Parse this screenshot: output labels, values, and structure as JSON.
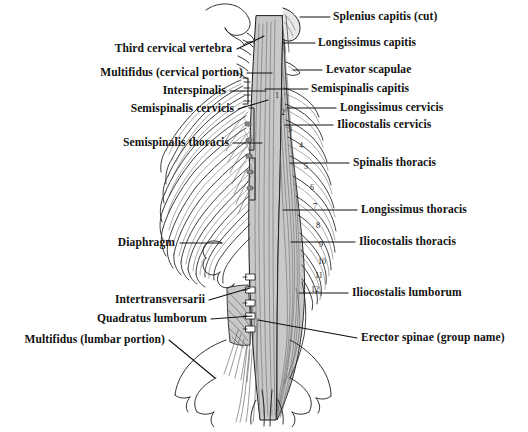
{
  "figure": {
    "width": 528,
    "height": 432,
    "background_color": "#ffffff",
    "ink_color": "#1a1a1a",
    "muscle_fill_color": "#c8c8c8",
    "bone_fill_color": "#ffffff",
    "shadow_fill_color": "#9a9a9a"
  },
  "labels_left": [
    {
      "text": "Third cervical vertebra",
      "x": 232,
      "y": 52,
      "leader": {
        "x1": 237,
        "y1": 49,
        "x2": 264,
        "y2": 36,
        "bend": [
          252,
          42
        ]
      }
    },
    {
      "text": "Multifidus (cervical portion)",
      "x": 243,
      "y": 76,
      "leader": {
        "x1": 247,
        "y1": 73,
        "x2": 272,
        "y2": 73
      }
    },
    {
      "text": "Interspinalis",
      "x": 226,
      "y": 94,
      "leader": {
        "x1": 230,
        "y1": 91,
        "x2": 266,
        "y2": 91
      }
    },
    {
      "text": "Semispinalis cervicis",
      "x": 234,
      "y": 112,
      "leader": {
        "x1": 238,
        "y1": 109,
        "x2": 268,
        "y2": 100
      }
    },
    {
      "text": "Semispinalis thoracis",
      "x": 229,
      "y": 146,
      "leader": {
        "x1": 233,
        "y1": 143,
        "x2": 262,
        "y2": 143
      }
    },
    {
      "text": "Diaphragm",
      "x": 175,
      "y": 246,
      "leader": {
        "x1": 180,
        "y1": 243,
        "x2": 222,
        "y2": 243
      }
    },
    {
      "text": "Intertransversarii",
      "x": 205,
      "y": 303,
      "leader": {
        "x1": 209,
        "y1": 300,
        "x2": 250,
        "y2": 288
      }
    },
    {
      "text": "Quadratus lumborum",
      "x": 207,
      "y": 322,
      "leader": {
        "x1": 211,
        "y1": 319,
        "x2": 252,
        "y2": 316
      }
    },
    {
      "text": "Multifidus (lumbar portion)",
      "x": 165,
      "y": 343,
      "leader": {
        "x1": 169,
        "y1": 340,
        "x2": 215,
        "y2": 378
      }
    }
  ],
  "labels_right": [
    {
      "text": "Splenius capitis (cut)",
      "x": 333,
      "y": 20,
      "leader": {
        "x1": 330,
        "y1": 17,
        "x2": 300,
        "y2": 17
      }
    },
    {
      "text": "Longissimus capitis",
      "x": 318,
      "y": 46,
      "leader": {
        "x1": 315,
        "y1": 43,
        "x2": 283,
        "y2": 43
      }
    },
    {
      "text": "Levator scapulae",
      "x": 326,
      "y": 73,
      "leader": {
        "x1": 322,
        "y1": 70,
        "x2": 293,
        "y2": 70
      }
    },
    {
      "text": "Semispinalis capitis",
      "x": 311,
      "y": 92,
      "leader": {
        "x1": 308,
        "y1": 89,
        "x2": 265,
        "y2": 89
      }
    },
    {
      "text": "Longissimus cervicis",
      "x": 340,
      "y": 111,
      "leader": {
        "x1": 336,
        "y1": 108,
        "x2": 287,
        "y2": 108
      }
    },
    {
      "text": "Iliocostalis cervicis",
      "x": 337,
      "y": 128,
      "leader": {
        "x1": 333,
        "y1": 125,
        "x2": 285,
        "y2": 125
      }
    },
    {
      "text": "Spinalis thoracis",
      "x": 353,
      "y": 166,
      "leader": {
        "x1": 349,
        "y1": 163,
        "x2": 290,
        "y2": 163
      }
    },
    {
      "text": "Longissimus thoracis",
      "x": 361,
      "y": 213,
      "leader": {
        "x1": 357,
        "y1": 210,
        "x2": 283,
        "y2": 210
      }
    },
    {
      "text": "Iliocostalis thoracis",
      "x": 359,
      "y": 245,
      "leader": {
        "x1": 355,
        "y1": 242,
        "x2": 291,
        "y2": 242
      }
    },
    {
      "text": "Iliocostalis lumborum",
      "x": 352,
      "y": 296,
      "leader": {
        "x1": 348,
        "y1": 293,
        "x2": 299,
        "y2": 293
      }
    },
    {
      "text": "Erector spinae (group name)",
      "x": 361,
      "y": 341,
      "leader": {
        "x1": 357,
        "y1": 338,
        "x2": 258,
        "y2": 320
      }
    }
  ],
  "rib_numbers": [
    {
      "n": "1",
      "x": 275,
      "y": 96
    },
    {
      "n": "2",
      "x": 281,
      "y": 113
    },
    {
      "n": "3",
      "x": 288,
      "y": 130
    },
    {
      "n": "4",
      "x": 299,
      "y": 146
    },
    {
      "n": "5",
      "x": 304,
      "y": 167
    },
    {
      "n": "6",
      "x": 310,
      "y": 188
    },
    {
      "n": "7",
      "x": 313,
      "y": 207
    },
    {
      "n": "8",
      "x": 316,
      "y": 226
    },
    {
      "n": "9",
      "x": 319,
      "y": 245
    },
    {
      "n": "10",
      "x": 318,
      "y": 262
    },
    {
      "n": "11",
      "x": 315,
      "y": 276
    },
    {
      "n": "12",
      "x": 311,
      "y": 290
    }
  ]
}
